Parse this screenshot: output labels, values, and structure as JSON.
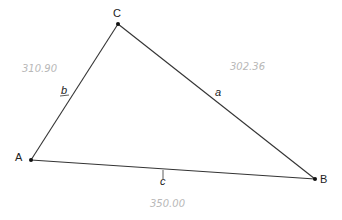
{
  "diagram": {
    "type": "triangle",
    "vertices": [
      {
        "id": "A",
        "label": "A",
        "x": 31,
        "y": 160
      },
      {
        "id": "B",
        "label": "B",
        "x": 315,
        "y": 179
      },
      {
        "id": "C",
        "label": "C",
        "x": 118,
        "y": 24
      }
    ],
    "sides": [
      {
        "id": "a",
        "label": "a",
        "from": "B",
        "to": "C",
        "length_note": "302.36"
      },
      {
        "id": "b",
        "label": "b",
        "from": "C",
        "to": "A",
        "length_note": "310.90"
      },
      {
        "id": "c",
        "label": "c",
        "from": "A",
        "to": "B",
        "length_note": "350.00"
      }
    ],
    "colors": {
      "line": "#333333",
      "point": "#111111",
      "annotation": "#b8b8b8"
    }
  }
}
